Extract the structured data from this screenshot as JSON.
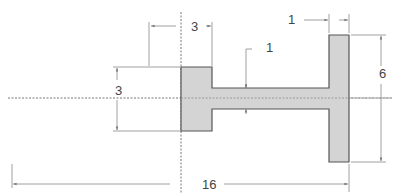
{
  "drawing": {
    "title": "T-section profile cross-section",
    "colors": {
      "fill": "#d4d4d4",
      "outline": "#555555",
      "dim_line": "#888888",
      "centerline": "#777777",
      "text": "#444444"
    },
    "dimensions": {
      "left_width": "3",
      "flange_width": "1",
      "web_thickness": "1",
      "left_height": "3",
      "flange_height": "6",
      "total_length": "16"
    }
  }
}
